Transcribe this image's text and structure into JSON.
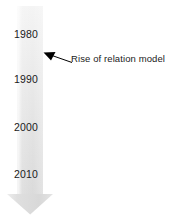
{
  "diagram": {
    "type": "timeline-arrow",
    "orientation": "vertical-downward",
    "background_color": "#ffffff",
    "band": {
      "name": "timeline-band",
      "fill_top_color": "#f2f2f2",
      "fill_bottom_color": "#d9d9d9",
      "edge_highlight_color": "#fafafa"
    },
    "arrowhead": {
      "name": "timeline-arrowhead",
      "direction": "down",
      "fill_color": "#dcdcdc"
    },
    "axis_labels": [
      {
        "id": "year-1980",
        "text": "1980"
      },
      {
        "id": "year-1990",
        "text": "1990"
      },
      {
        "id": "year-2000",
        "text": "2000"
      },
      {
        "id": "year-2010",
        "text": "2010"
      }
    ],
    "annotations": [
      {
        "id": "annotation-rise-of-relation-model",
        "text": "Rise of relation model",
        "leader_line_color": "#000000",
        "arrow_points_to": "timeline-band-between-1980-and-1990"
      }
    ]
  }
}
